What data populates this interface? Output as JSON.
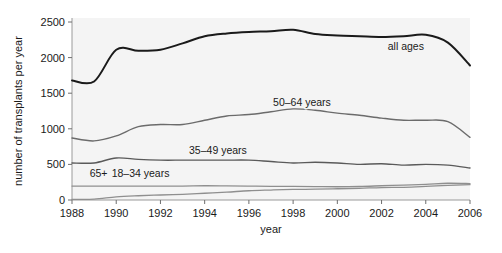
{
  "figure": {
    "background_color": "#ffffff",
    "plot_background_color": "#f4f4f4",
    "frame_color": "#9a9a9a"
  },
  "chart_data": {
    "type": "line",
    "title": "",
    "subtitle": "",
    "xlabel": "year",
    "ylabel": "number of transplants per year",
    "xlim": [
      1988,
      2006
    ],
    "ylim": [
      0,
      2500
    ],
    "grid": false,
    "legend_position": "inline-annotations",
    "xticks": [
      1988,
      1990,
      1992,
      1994,
      1996,
      1998,
      2000,
      2002,
      2004,
      2006
    ],
    "yticks": [
      0,
      500,
      1000,
      1500,
      2000,
      2500
    ],
    "x": [
      1988,
      1989,
      1990,
      1991,
      1992,
      1993,
      1994,
      1995,
      1996,
      1997,
      1998,
      1999,
      2000,
      2001,
      2002,
      2003,
      2004,
      2005,
      2006
    ],
    "series": [
      {
        "name": "all ages",
        "label": "all ages",
        "color": "#1a1a1a",
        "width": 2.0,
        "label_x": 2003.1,
        "label_y": 2110,
        "values": [
          1680,
          1665,
          2110,
          2095,
          2110,
          2200,
          2300,
          2340,
          2360,
          2370,
          2390,
          2330,
          2310,
          2300,
          2290,
          2300,
          2320,
          2210,
          1890
        ]
      },
      {
        "name": "50-64 years",
        "label": "50–64 years",
        "color": "#6b6b6b",
        "width": 1.4,
        "label_x": 1998.4,
        "label_y": 1320,
        "values": [
          870,
          830,
          900,
          1030,
          1060,
          1060,
          1120,
          1180,
          1200,
          1240,
          1280,
          1260,
          1220,
          1190,
          1150,
          1120,
          1120,
          1100,
          880
        ]
      },
      {
        "name": "35-49 years",
        "label": "35–49 years",
        "color": "#5a5a5a",
        "width": 1.4,
        "label_x": 1994.6,
        "label_y": 640,
        "values": [
          520,
          520,
          590,
          570,
          560,
          560,
          560,
          560,
          560,
          540,
          520,
          530,
          520,
          500,
          510,
          490,
          500,
          490,
          450
        ]
      },
      {
        "name": "18-34 years",
        "label": "18–34 years",
        "color": "#8f8f8f",
        "width": 1.3,
        "label_x": 1991.1,
        "label_y": 330,
        "values": [
          195,
          195,
          195,
          195,
          195,
          195,
          200,
          198,
          195,
          192,
          190,
          188,
          186,
          190,
          200,
          210,
          220,
          235,
          230
        ]
      },
      {
        "name": "65+",
        "label": "65+",
        "color": "#8f8f8f",
        "width": 1.3,
        "label_x": 1989.2,
        "label_y": 330,
        "values": [
          10,
          12,
          45,
          60,
          70,
          80,
          95,
          110,
          130,
          140,
          148,
          152,
          158,
          165,
          175,
          178,
          190,
          205,
          215
        ]
      }
    ]
  },
  "caption": {
    "text": ""
  }
}
